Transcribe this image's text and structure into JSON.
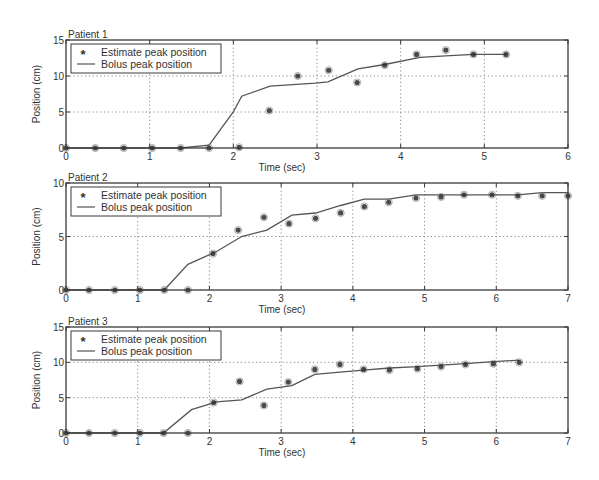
{
  "figure": {
    "background": "#ffffff",
    "ink": "#3a3a3a",
    "grid_color": "#8a8a8a",
    "marker_color": "#2a2a2a",
    "line_color": "#555555"
  },
  "chart_data": [
    {
      "type": "line",
      "title": "Patient 1",
      "xlabel": "Time (sec)",
      "ylabel": "Position (cm)",
      "xlim": [
        0,
        6
      ],
      "ylim": [
        0,
        15
      ],
      "xticks": [
        0,
        1,
        2,
        3,
        4,
        5,
        6
      ],
      "yticks": [
        0,
        5,
        10,
        15
      ],
      "grid": true,
      "legend": {
        "position": "upper left",
        "entries": [
          "Estimate peak position",
          "Bolus peak position"
        ]
      },
      "box": {
        "left": 66,
        "right": 568,
        "top": 40,
        "bottom": 148
      },
      "series": [
        {
          "name": "Estimate peak position",
          "style": "markers",
          "marker": "*",
          "x": [
            0,
            0.35,
            0.69,
            1.03,
            1.37,
            1.71,
            2.07,
            2.43,
            2.77,
            3.14,
            3.48,
            3.81,
            4.19,
            4.54,
            4.87,
            5.26
          ],
          "y": [
            0,
            0,
            0,
            0,
            0,
            0,
            0.1,
            5.2,
            10.0,
            10.8,
            9.1,
            11.5,
            13.0,
            13.6,
            13.0,
            13.0
          ]
        },
        {
          "name": "Bolus peak position",
          "style": "line",
          "x": [
            0,
            0.35,
            0.69,
            1.03,
            1.37,
            1.71,
            2.0,
            2.1,
            2.44,
            2.98,
            3.13,
            3.49,
            3.81,
            4.23,
            4.54,
            4.87,
            5.26
          ],
          "y": [
            0,
            0,
            0,
            0,
            0,
            0.4,
            5.0,
            7.2,
            8.6,
            9.0,
            9.2,
            11.0,
            11.6,
            12.6,
            12.8,
            13.0,
            13.0
          ]
        }
      ]
    },
    {
      "type": "line",
      "title": "Patient 2",
      "xlabel": "Time (sec)",
      "ylabel": "Position (cm)",
      "xlim": [
        0,
        7
      ],
      "ylim": [
        0,
        10
      ],
      "xticks": [
        0,
        1,
        2,
        3,
        4,
        5,
        6,
        7
      ],
      "yticks": [
        0,
        5,
        10
      ],
      "grid": true,
      "legend": {
        "position": "upper left",
        "entries": [
          "Estimate peak position",
          "Bolus peak position"
        ]
      },
      "box": {
        "left": 66,
        "right": 568,
        "top": 183,
        "bottom": 290
      },
      "series": [
        {
          "name": "Estimate peak position",
          "style": "markers",
          "marker": "*",
          "x": [
            0,
            0.32,
            0.68,
            1.03,
            1.37,
            1.7,
            2.05,
            2.4,
            2.76,
            3.11,
            3.48,
            3.83,
            4.16,
            4.5,
            4.88,
            5.23,
            5.55,
            5.94,
            6.3,
            6.64,
            7.0
          ],
          "y": [
            0,
            0,
            0,
            0,
            0,
            0,
            3.4,
            5.6,
            6.8,
            6.2,
            6.7,
            7.2,
            7.8,
            8.2,
            8.6,
            8.7,
            8.9,
            8.9,
            8.8,
            8.8,
            8.8
          ]
        },
        {
          "name": "Bolus peak position",
          "style": "line",
          "x": [
            0,
            0.32,
            0.68,
            1.03,
            1.37,
            1.7,
            2.1,
            2.45,
            2.8,
            3.15,
            3.48,
            3.83,
            4.16,
            4.5,
            4.88,
            5.23,
            5.55,
            5.94,
            6.3,
            6.64,
            7.0
          ],
          "y": [
            0,
            0,
            0,
            0,
            0,
            2.4,
            3.6,
            5.0,
            5.6,
            7.0,
            7.2,
            7.9,
            8.5,
            8.5,
            8.9,
            8.9,
            8.9,
            8.9,
            8.9,
            9.1,
            9.1
          ]
        }
      ]
    },
    {
      "type": "line",
      "title": "Patient 3",
      "xlabel": "Time (sec)",
      "ylabel": "Position (cm)",
      "xlim": [
        0,
        7
      ],
      "ylim": [
        0,
        15
      ],
      "xticks": [
        0,
        1,
        2,
        3,
        4,
        5,
        6,
        7
      ],
      "yticks": [
        0,
        5,
        10,
        15
      ],
      "grid": true,
      "legend": {
        "position": "upper left",
        "entries": [
          "Estimate peak position",
          "Bolus peak position"
        ]
      },
      "box": {
        "left": 66,
        "right": 568,
        "top": 327,
        "bottom": 433
      },
      "series": [
        {
          "name": "Estimate peak position",
          "style": "markers",
          "marker": "*",
          "x": [
            0,
            0.32,
            0.68,
            1.03,
            1.36,
            1.7,
            2.06,
            2.42,
            2.76,
            3.1,
            3.47,
            3.82,
            4.15,
            4.51,
            4.9,
            5.23,
            5.57,
            5.96,
            6.32
          ],
          "y": [
            0,
            0,
            0,
            0,
            0,
            0,
            4.3,
            7.3,
            3.9,
            7.2,
            9.0,
            9.7,
            9.0,
            8.9,
            9.1,
            9.4,
            9.7,
            9.8,
            10.0
          ]
        },
        {
          "name": "Bolus peak position",
          "style": "line",
          "x": [
            0,
            0.32,
            0.68,
            1.03,
            1.36,
            1.75,
            2.1,
            2.45,
            2.8,
            3.15,
            3.47,
            3.82,
            4.15,
            4.51,
            4.9,
            5.23,
            5.57,
            5.96,
            6.32
          ],
          "y": [
            0,
            0,
            0,
            0,
            0,
            3.3,
            4.4,
            4.7,
            6.2,
            6.7,
            8.3,
            8.6,
            8.9,
            9.2,
            9.4,
            9.6,
            9.8,
            10.1,
            10.3
          ]
        }
      ]
    }
  ]
}
